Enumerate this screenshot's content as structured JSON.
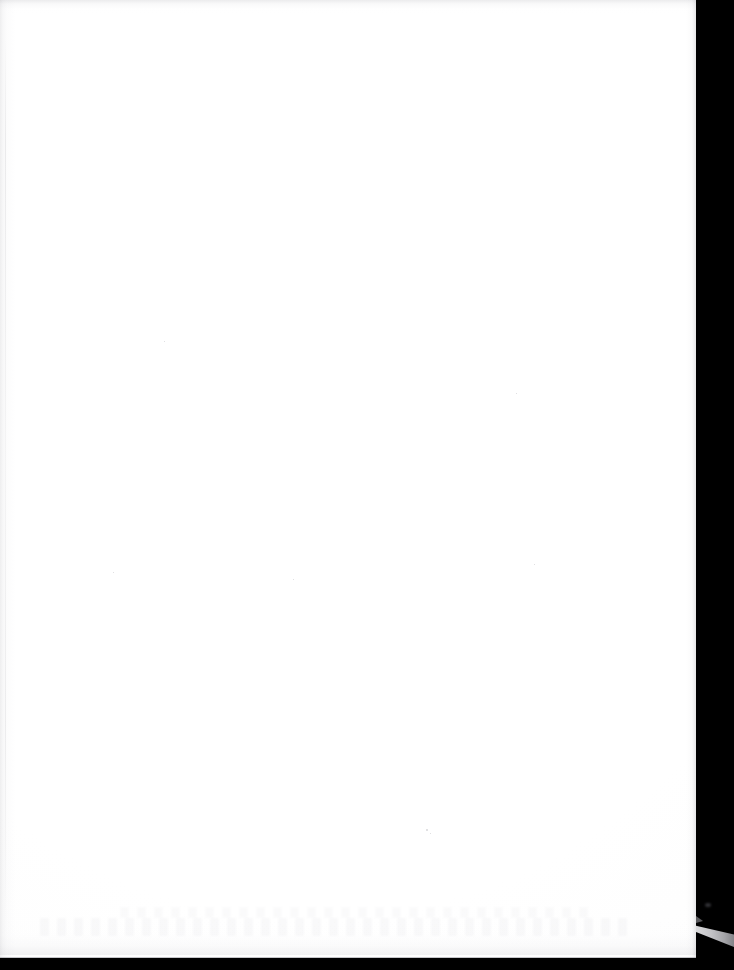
{
  "document": {
    "kind": "scanned-page-image",
    "page_content_text": "",
    "page_label": "Blank scanned page",
    "caption": ""
  },
  "canvas": {
    "width": 734,
    "height": 970,
    "background_color": "#000000"
  },
  "page": {
    "name": "scanned-paper-sheet",
    "color": "#fdfdfd",
    "left": 0,
    "top": 0,
    "width": 696,
    "height": 958,
    "edge_line_color": "#969698",
    "text_content": ""
  },
  "scanner_backing": {
    "name": "scanner-backing-band",
    "color": "#000000",
    "left": 695,
    "width": 39
  },
  "artifacts": {
    "light_wedge": {
      "name": "light-leak-wedge",
      "color": "#ecece e",
      "left": 696,
      "top": 921,
      "width": 38,
      "height": 26
    },
    "specks": [
      {
        "name": "dust-speck",
        "x": 426,
        "y": 829,
        "size": 2
      },
      {
        "name": "dust-speck",
        "x": 430,
        "y": 833,
        "size": 1
      },
      {
        "name": "dust-speck",
        "x": 164,
        "y": 341,
        "size": 1
      },
      {
        "name": "dust-speck",
        "x": 516,
        "y": 393,
        "size": 1
      },
      {
        "name": "dust-speck",
        "x": 534,
        "y": 564,
        "size": 1
      },
      {
        "name": "dust-speck",
        "x": 113,
        "y": 572,
        "size": 1
      },
      {
        "name": "dust-speck",
        "x": 293,
        "y": 579,
        "size": 1
      }
    ],
    "edge_noise": {
      "top_band_height": 14,
      "bottom_band_height": 34,
      "left_streak_width": 16
    }
  }
}
